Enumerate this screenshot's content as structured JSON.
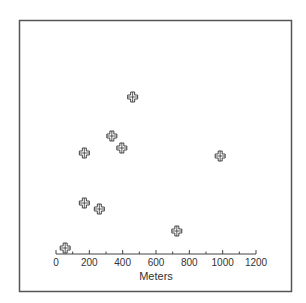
{
  "chart_data": {
    "type": "scatter",
    "title": "",
    "xlabel": "Meters",
    "ylabel": "",
    "xlim": [
      0,
      1200
    ],
    "x_ticks": [
      0,
      200,
      400,
      600,
      800,
      1000,
      1200
    ],
    "x_tick_labels": [
      "0",
      "200",
      "400",
      "600",
      "800",
      "1000",
      "1200"
    ],
    "x_minor_tick_step": 100,
    "y_axis_visible": false,
    "y_units": "relative height above x-axis (unlabeled)",
    "ylim": [
      0,
      200
    ],
    "grid": false,
    "legend": null,
    "marker": "outlined-cross",
    "series": [
      {
        "name": "points",
        "points": [
          {
            "x": 55,
            "y": 6
          },
          {
            "x": 170,
            "y": 101
          },
          {
            "x": 460,
            "y": 157
          },
          {
            "x": 335,
            "y": 118
          },
          {
            "x": 395,
            "y": 106
          },
          {
            "x": 170,
            "y": 51
          },
          {
            "x": 260,
            "y": 45
          },
          {
            "x": 985,
            "y": 98
          },
          {
            "x": 725,
            "y": 23
          }
        ]
      }
    ],
    "colors": {
      "frame": "#555555",
      "axis": "#444444",
      "marker": "#333333",
      "background": "#ffffff"
    }
  }
}
